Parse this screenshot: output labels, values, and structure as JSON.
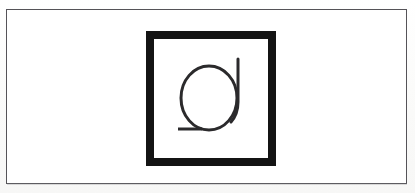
{
  "page": {
    "background_color": "#fdfdfc"
  },
  "plate": {
    "border_color": "#555358",
    "fill_color": "#ffffff",
    "border_width_px": 1,
    "x": 6,
    "y": 9,
    "width": 401,
    "height": 175
  },
  "frame": {
    "name": "thick-square-frame",
    "stroke_color": "#141414",
    "fill_color": "#ffffff",
    "border_width_px": 8,
    "x": 146,
    "y": 31,
    "width": 130,
    "height": 135
  },
  "glyph": {
    "name": "rotated-letter-a",
    "description": "Circle with vertical stem at right rising above the bowl and a horizontal tail at lower left",
    "stroke_color": "#2b2a2c",
    "stroke_width_px": 3,
    "fill": "none",
    "bowl": {
      "center_x": 209,
      "center_y": 98,
      "radius_x": 28,
      "radius_y": 32
    },
    "stem": {
      "x": 238,
      "y_top": 59,
      "y_bottom": 108
    },
    "tail": {
      "x_left": 178,
      "x_right": 202,
      "y": 129
    }
  }
}
